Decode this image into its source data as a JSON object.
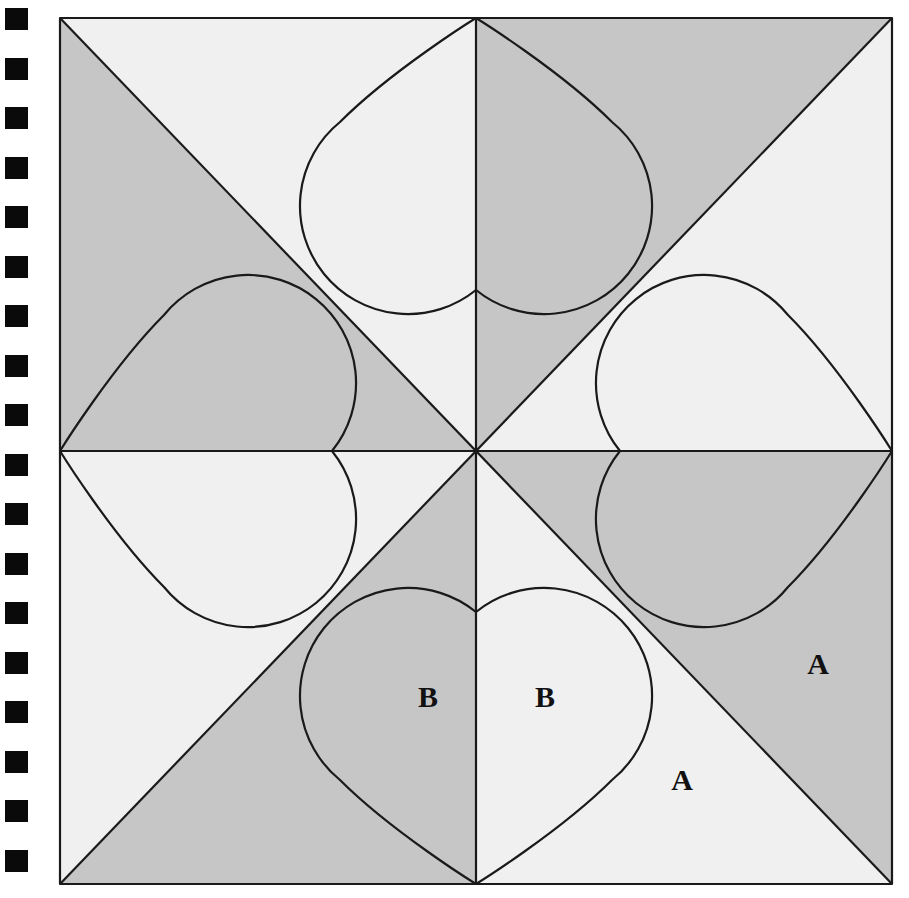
{
  "figure": {
    "kind": "geometric-diagram",
    "canvas": {
      "width": 909,
      "height": 898
    },
    "square": {
      "left": 60,
      "top": 18,
      "right": 892,
      "bottom": 884,
      "center_x": 476,
      "center_y": 451
    },
    "colors": {
      "background": "#ffffff",
      "light_fill": "#f0f0f0",
      "gray_fill": "#c6c6c6",
      "stroke": "#1a1a1a",
      "label_text": "#111111",
      "margin_square": "#0a0a0a"
    },
    "stroke_width": 2.2,
    "construction": {
      "diagonals": true,
      "vertical_midline": true,
      "horizontal_midline": true,
      "hearts": 4,
      "heart_positions": [
        "top",
        "right",
        "bottom",
        "left"
      ],
      "heart_tip_anchor": "edge-midpoint",
      "heart_cusp_anchor": "square-center-offset"
    }
  },
  "labels": [
    {
      "id": "label-a-upper",
      "text": "A",
      "x": 818,
      "y": 667,
      "region": "light"
    },
    {
      "id": "label-a-lower",
      "text": "A",
      "x": 682,
      "y": 783,
      "region": "gray"
    },
    {
      "id": "label-b-left",
      "text": "B",
      "x": 428,
      "y": 700,
      "region": "gray"
    },
    {
      "id": "label-b-right",
      "text": "B",
      "x": 545,
      "y": 700,
      "region": "light"
    }
  ],
  "margin_marks": {
    "name": "binding-punch-holes",
    "count": 18,
    "x": 5,
    "width": 23,
    "height": 22,
    "first_y": 8,
    "pitch": 49.5
  }
}
